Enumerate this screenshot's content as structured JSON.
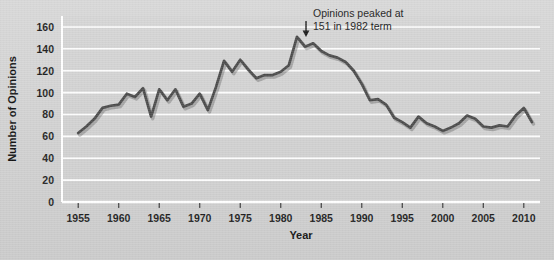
{
  "chart_data": {
    "type": "line",
    "title": "",
    "xlabel": "Year",
    "ylabel": "Number of Opinions",
    "xlim": [
      1953,
      2012
    ],
    "ylim": [
      0,
      170
    ],
    "ytick_values": [
      0,
      20,
      40,
      60,
      80,
      100,
      120,
      140,
      160
    ],
    "ytick_labels": [
      "0",
      "20",
      "40",
      "60",
      "80",
      "100",
      "120",
      "140",
      "160"
    ],
    "xtick_values": [
      1955,
      1960,
      1965,
      1970,
      1975,
      1980,
      1985,
      1990,
      1995,
      2000,
      2005,
      2010
    ],
    "xtick_labels": [
      "1955",
      "1960",
      "1965",
      "1970",
      "1975",
      "1980",
      "1985",
      "1990",
      "1995",
      "2000",
      "2005",
      "2010"
    ],
    "grid": "horizontal",
    "legend": "none",
    "line_color": "#4a4a4a",
    "series": [
      {
        "name": "Number of Opinions",
        "x": [
          1955,
          1956,
          1957,
          1958,
          1959,
          1960,
          1961,
          1962,
          1963,
          1964,
          1965,
          1966,
          1967,
          1968,
          1969,
          1970,
          1971,
          1972,
          1973,
          1974,
          1975,
          1976,
          1977,
          1978,
          1979,
          1980,
          1981,
          1982,
          1983,
          1984,
          1985,
          1986,
          1987,
          1988,
          1989,
          1990,
          1991,
          1992,
          1993,
          1994,
          1995,
          1996,
          1997,
          1998,
          1999,
          2000,
          2001,
          2002,
          2003,
          2004,
          2005,
          2006,
          2007,
          2008,
          2009,
          2010,
          2011
        ],
        "values": [
          63,
          69,
          76,
          86,
          88,
          89,
          99,
          96,
          104,
          78,
          103,
          93,
          103,
          87,
          90,
          99,
          84,
          105,
          129,
          119,
          130,
          121,
          113,
          116,
          116,
          119,
          125,
          151,
          142,
          145,
          138,
          134,
          132,
          128,
          120,
          108,
          93,
          94,
          89,
          77,
          73,
          68,
          78,
          72,
          69,
          65,
          68,
          72,
          79,
          76,
          69,
          68,
          70,
          69,
          79,
          86,
          73
        ]
      }
    ],
    "annotations": [
      {
        "name": "peak-annotation",
        "line1": "Opinions peaked at",
        "line2": "151 in 1982 term",
        "target_x": 1982,
        "target_y": 151
      }
    ]
  }
}
